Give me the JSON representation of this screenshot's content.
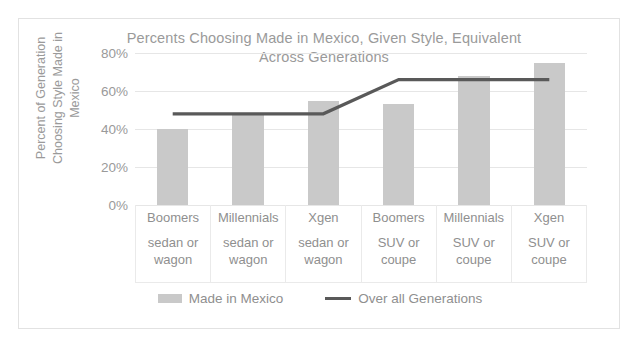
{
  "chart_data": {
    "type": "bar",
    "title": "Percents Choosing Made in Mexico, Given Style, Equivalent Across Generations",
    "title_line1": "Percents Choosing Made in Mexico, Given Style, Equivalent",
    "title_line2": "Across Generations",
    "xlabel": "",
    "ylabel": "Percent of Generation Choosing Style Made in Mexico",
    "ylabel_line1": "Percent of Generation",
    "ylabel_line2": "Choosing Style Made in",
    "ylabel_line3": "Mexico",
    "ylim": [
      0,
      0.8
    ],
    "ytick_labels": [
      "0%",
      "20%",
      "40%",
      "60%",
      "80%"
    ],
    "ytick_values": [
      0,
      20,
      40,
      60,
      80
    ],
    "grid": true,
    "legend_position": "bottom",
    "categories": [
      {
        "generation": "Boomers",
        "style": "sedan or\nwagon"
      },
      {
        "generation": "Millennials",
        "style": "sedan or\nwagon"
      },
      {
        "generation": "Xgen",
        "style": "sedan or\nwagon"
      },
      {
        "generation": "Boomers",
        "style": "SUV or\ncoupe"
      },
      {
        "generation": "Millennials",
        "style": "SUV or\ncoupe"
      },
      {
        "generation": "Xgen",
        "style": "SUV or\ncoupe"
      }
    ],
    "series": [
      {
        "name": "Made in Mexico",
        "kind": "bar",
        "color": "#c9c9c9",
        "values": [
          40,
          48,
          55,
          53,
          68,
          75
        ]
      },
      {
        "name": "Over all Generations",
        "kind": "line",
        "color": "#595959",
        "values": [
          48,
          48,
          48,
          66,
          66,
          66
        ]
      }
    ]
  },
  "legend": {
    "items": [
      {
        "label": "Made in Mexico",
        "marker": "bar-swatch"
      },
      {
        "label": "Over all Generations",
        "marker": "line-swatch"
      }
    ]
  }
}
